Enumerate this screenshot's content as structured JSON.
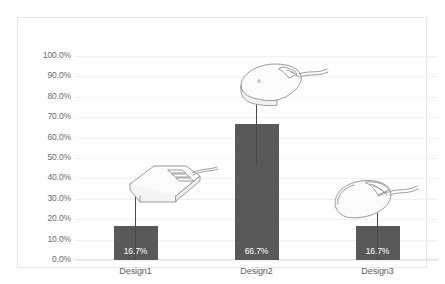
{
  "chart_data": {
    "type": "bar",
    "title": "",
    "xlabel": "",
    "ylabel": "",
    "categories": [
      "Design1",
      "Design2",
      "Design3"
    ],
    "values": [
      16.7,
      66.7,
      16.7
    ],
    "value_labels": [
      "16.7%",
      "66.7%",
      "16.7%"
    ],
    "error_bars": [
      {
        "low": 0.0,
        "high": 36.0
      },
      {
        "low": 47.0,
        "high": 82.0
      },
      {
        "low": 0.0,
        "high": 36.0
      }
    ],
    "ylim": [
      0,
      100
    ],
    "ytick_values": [
      0,
      10,
      20,
      30,
      40,
      50,
      60,
      70,
      80,
      90,
      100
    ],
    "ytick_labels": [
      "0.0%",
      "10.0%",
      "20.0%",
      "30.0%",
      "40.0%",
      "50.0%",
      "60.0%",
      "70.0%",
      "80.0%",
      "90.0%",
      "100.0%"
    ],
    "grid": true,
    "legend": "none",
    "bar_color": "#595959",
    "grid_color": "#f0f0f0",
    "label_color": "#6b6b6b",
    "annotations": [
      {
        "name": "retro-boxy-mouse-illustration",
        "category": "Design1"
      },
      {
        "name": "ergonomic-rounded-mouse-illustration",
        "category": "Design2"
      },
      {
        "name": "modern-topview-mouse-illustration",
        "category": "Design3"
      }
    ]
  }
}
